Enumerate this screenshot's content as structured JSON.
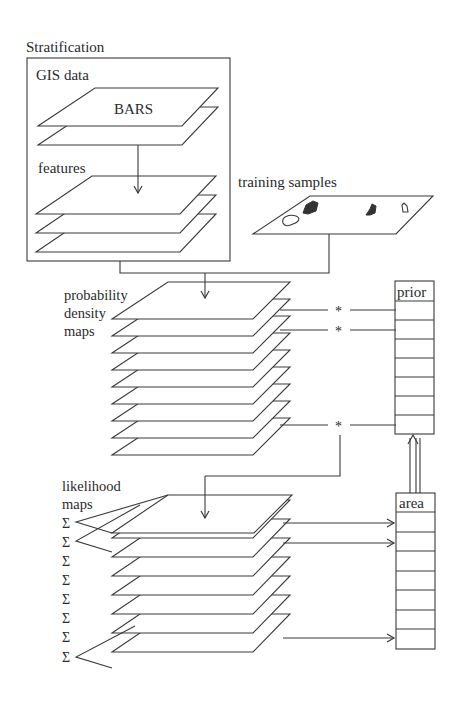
{
  "diagram": {
    "stratification": {
      "title": "Stratification",
      "gis_label": "GIS data",
      "bars_label": "BARS",
      "features_label": "features"
    },
    "training": {
      "label": "training samples"
    },
    "probability": {
      "label_line1": "probability",
      "label_line2": "density",
      "label_line3": "maps",
      "layer_count": 9,
      "multiply_symbol": "*"
    },
    "likelihood": {
      "label_line1": "likelihood",
      "label_line2": "maps",
      "layer_count": 8,
      "sum_symbol": "Σ"
    },
    "prior_table": {
      "header": "prior",
      "row_count": 7
    },
    "area_table": {
      "header": "area",
      "row_count": 7
    },
    "colors": {
      "line": "#3a3a3a",
      "text": "#2a2a2a",
      "background": "#ffffff",
      "sample_fill": "#333333"
    }
  }
}
